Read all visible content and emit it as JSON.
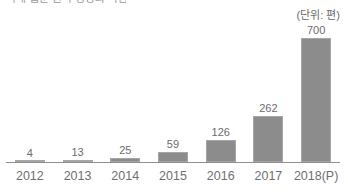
{
  "title": {
    "text_partial": "국내 웹툰 원작 영상화 작품 수"
  },
  "unit": {
    "label": "(단위: 편)"
  },
  "chart_data": {
    "type": "bar",
    "title": "",
    "xlabel": "",
    "ylabel": "",
    "ylim": [
      0,
      700
    ],
    "grid": false,
    "legend": "none",
    "bar_color": "#8c8c8c",
    "text_color": "#6b6b6b",
    "axis_color": "#8f8f8f",
    "background": "#ffffff",
    "categories": [
      "2012",
      "2013",
      "2014",
      "2015",
      "2016",
      "2017",
      "2018(P)"
    ],
    "values": [
      4,
      13,
      25,
      59,
      126,
      262,
      700
    ],
    "value_labels": [
      "4",
      "13",
      "25",
      "59",
      "126",
      "262",
      "700"
    ],
    "annotations": [
      "(단위: 편)"
    ]
  }
}
